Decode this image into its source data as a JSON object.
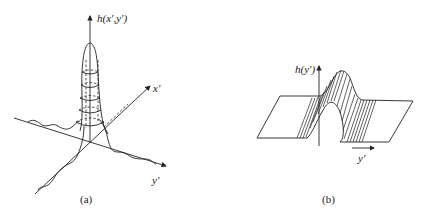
{
  "figure": {
    "panels": [
      {
        "id": "a",
        "caption": "(a)",
        "description": "2D point spread function surface with rings",
        "axes": {
          "vertical_label": "h(x′,y′)",
          "x_label": "x′",
          "y_label": "y′"
        }
      },
      {
        "id": "b",
        "caption": "(b)",
        "description": "1D line spread function extruded as a ridge",
        "axes": {
          "vertical_label": "h(y′)",
          "y_label": "y′"
        }
      }
    ],
    "colors": {
      "line": "#222222",
      "background": "#ffffff"
    }
  }
}
